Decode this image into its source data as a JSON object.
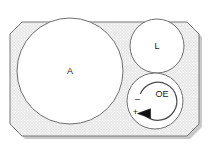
{
  "diagram": {
    "background_color": "#ffffff",
    "plate": {
      "name": "plate-body",
      "fill_color": "#ececec",
      "stipple_color": "#ffffff",
      "outline_color": "#707070",
      "shadow_color": "#b8b8b8",
      "shape": "chamfered-rectangle"
    },
    "circles": [
      {
        "id": "circle-a",
        "label": "A",
        "fill_color": "#ffffff",
        "outline_color": "#6e6e6e",
        "cx": 70,
        "cy": 71,
        "r": 53
      },
      {
        "id": "circle-l",
        "label": "L",
        "fill_color": "#ffffff",
        "outline_color": "#6e6e6e",
        "cx": 157,
        "cy": 46,
        "r": 27
      },
      {
        "id": "circle-oe",
        "label": "OE",
        "fill_color": "#ffffff",
        "outline_color": "#6e6e6e",
        "cx": 155,
        "cy": 101,
        "r": 28
      }
    ],
    "dial": {
      "id": "oe-dial",
      "label": "OE",
      "arc_color": "#4a4a4a",
      "arrow_color": "#111111",
      "minus_sign": "–",
      "plus_sign": "+",
      "direction": "counter-clockwise"
    }
  }
}
